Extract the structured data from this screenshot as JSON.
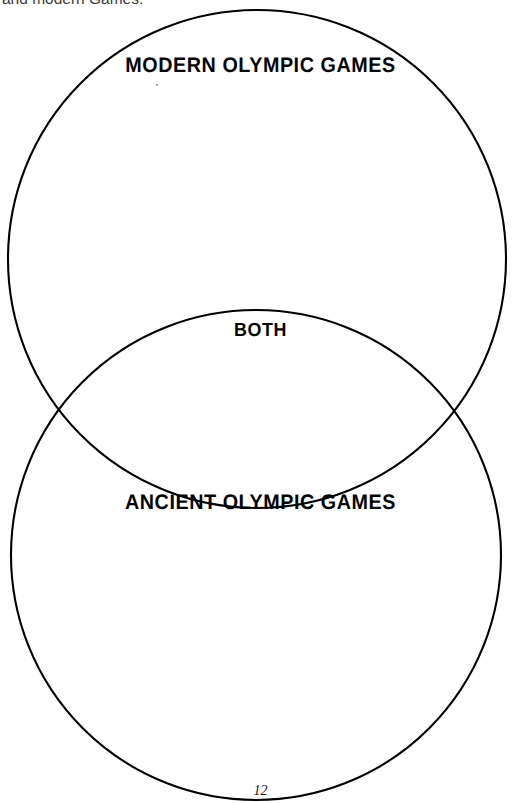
{
  "page": {
    "width": 521,
    "height": 803,
    "background_color": "#ffffff",
    "ink_color": "#000000",
    "page_number": "12"
  },
  "body_text": {
    "truncated_sentence": "and modern Games."
  },
  "venn": {
    "title_top": "MODERN OLYMPIC GAMES",
    "title_overlap": "BOTH",
    "title_bottom": "ANCIENT OLYMPIC GAMES",
    "circles": [
      {
        "name": "modern-olympic-games-circle",
        "label": "MODERN OLYMPIC GAMES",
        "cx": 257,
        "cy": 259,
        "r": 249
      },
      {
        "name": "ancient-olympic-games-circle",
        "label": "ANCIENT OLYMPIC GAMES",
        "cx": 256,
        "cy": 555,
        "r": 245
      }
    ],
    "intersection_points": [
      {
        "x": 63,
        "y": 394
      },
      {
        "x": 450,
        "y": 395
      }
    ],
    "stroke_width": 2.1,
    "stroke_color": "#000000",
    "fill": "none"
  }
}
